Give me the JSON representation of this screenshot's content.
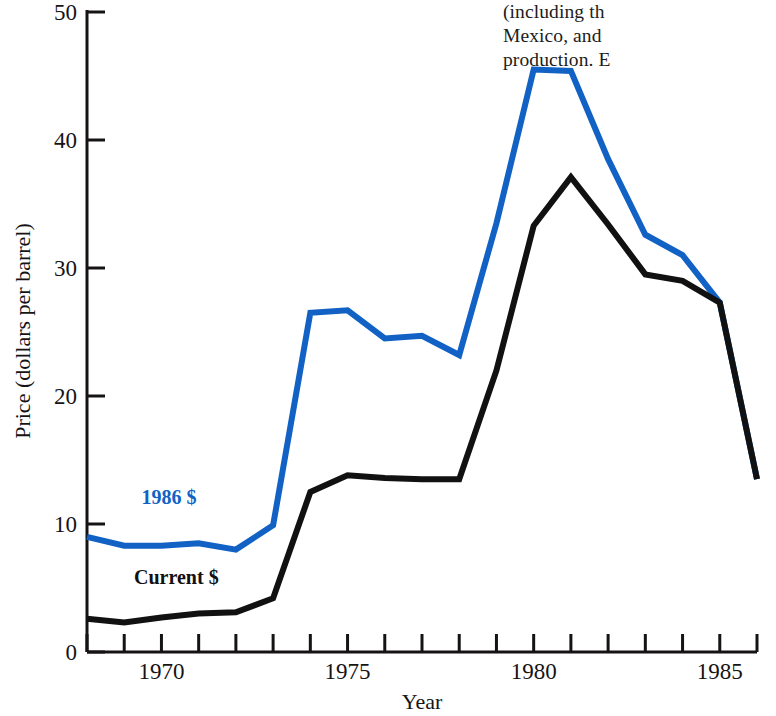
{
  "page": {
    "background_color": "#ffffff",
    "width": 776,
    "height": 716
  },
  "body_text_column": {
    "lines": [
      "(including th",
      "Mexico, and ",
      "production. E"
    ]
  },
  "chart_data": {
    "type": "line",
    "title": "",
    "xlabel": "Year",
    "ylabel": "Price (dollars per barrel)",
    "xlim": [
      1968,
      1986
    ],
    "ylim": [
      0,
      50
    ],
    "grid": false,
    "legend_position": "inline-labels",
    "x": [
      1968,
      1969,
      1970,
      1971,
      1972,
      1973,
      1974,
      1975,
      1976,
      1977,
      1978,
      1979,
      1980,
      1981,
      1982,
      1983,
      1984,
      1985,
      1986
    ],
    "y_ticks": [
      0,
      10,
      20,
      30,
      40,
      50
    ],
    "y_tick_labels": [
      "0",
      "10",
      "20",
      "30",
      "40",
      "50"
    ],
    "x_ticks": [
      1968,
      1969,
      1970,
      1971,
      1972,
      1973,
      1974,
      1975,
      1976,
      1977,
      1978,
      1979,
      1980,
      1981,
      1982,
      1983,
      1984,
      1985,
      1986
    ],
    "x_tick_labels_shown": [
      {
        "value": 1970,
        "label": "1970"
      },
      {
        "value": 1975,
        "label": "1975"
      },
      {
        "value": 1980,
        "label": "1980"
      },
      {
        "value": 1985,
        "label": "1985"
      }
    ],
    "series": [
      {
        "name": "1986 $",
        "color": "#1162c4",
        "label_x": 1970.2,
        "label_y": 11.6,
        "values": [
          9.0,
          8.3,
          8.3,
          8.5,
          8.0,
          9.9,
          26.5,
          26.7,
          24.5,
          24.7,
          23.2,
          33.5,
          45.5,
          45.4,
          38.5,
          32.6,
          31.0,
          27.3,
          13.5
        ]
      },
      {
        "name": "Current $",
        "color": "#111111",
        "label_x": 1970.4,
        "label_y": 5.3,
        "values": [
          2.6,
          2.3,
          2.7,
          3.0,
          3.1,
          4.2,
          12.5,
          13.8,
          13.6,
          13.5,
          13.5,
          22.0,
          33.3,
          37.1,
          33.4,
          29.5,
          29.0,
          27.3,
          13.5
        ]
      }
    ]
  }
}
